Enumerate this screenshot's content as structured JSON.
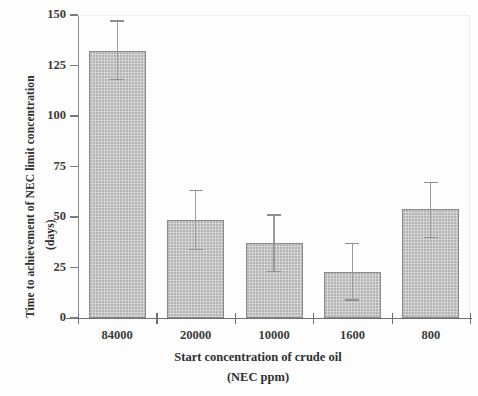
{
  "chart_data": {
    "type": "bar",
    "title": "",
    "xlabel": "Start concentration of crude oil (NEC ppm)",
    "xlabel_line1": "Start concentration of crude oil",
    "xlabel_line2": "(NEC ppm)",
    "ylabel": "Time to achievement of NEC limit concentration (days)",
    "ylabel_line1": "Time to achievement of NEC limit concentration",
    "ylabel_line2": "(days)",
    "categories": [
      "84000",
      "20000",
      "10000",
      "1600",
      "800"
    ],
    "values": [
      132,
      48.5,
      37,
      23,
      54
    ],
    "error_upper": [
      147,
      63,
      51,
      37,
      67
    ],
    "error_lower": [
      118,
      34,
      23,
      9,
      40
    ],
    "ylim": [
      0,
      150
    ],
    "yticks": [
      0,
      25,
      50,
      75,
      100,
      125,
      150
    ],
    "ytick_labels": [
      "0",
      "25",
      "50",
      "75",
      "100",
      "125",
      "150"
    ],
    "grid": false,
    "legend": null,
    "bar_color": "#cfcfcf",
    "bar_edge_color": "#8a8a8a",
    "error_color": "#8f8f8f",
    "axis_color": "#6f6f6f"
  }
}
